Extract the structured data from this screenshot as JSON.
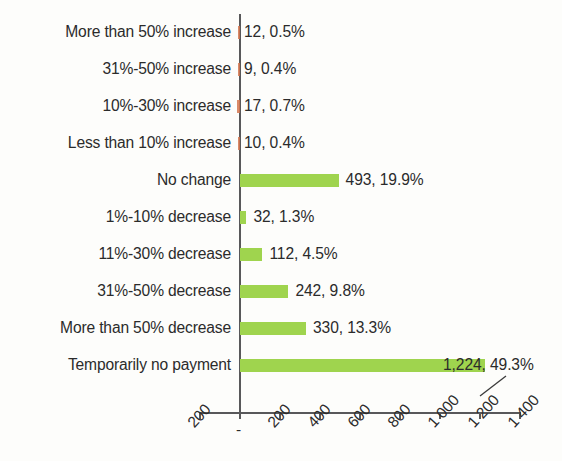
{
  "chart_data": {
    "type": "bar",
    "orientation": "horizontal",
    "title": "",
    "subtitle": "",
    "xlabel": "",
    "ylabel": "",
    "xlim": [
      -200,
      1400
    ],
    "grid": false,
    "legend": null,
    "axis_tick_labels": [
      "200",
      "-",
      "200",
      "400",
      "600",
      "800",
      "1 000",
      "1 200",
      "1 400"
    ],
    "axis_tick_values": [
      -200,
      0,
      200,
      400,
      600,
      800,
      1000,
      1200,
      1400
    ],
    "colors": {
      "positive_bar": "#9fd44e",
      "negative_bar": "#d4764f",
      "axis": "#58585a",
      "text": "#2b2b2b",
      "background": "#fdfdfb"
    },
    "categories": [
      "More than 50% increase",
      "31%-50% increase",
      "10%-30% increase",
      "Less than 10% increase",
      "No change",
      "1%-10% decrease",
      "11%-30% decrease",
      "31%-50% decrease",
      "More than 50% decrease",
      "Temporarily no payment"
    ],
    "values": [
      12,
      9,
      17,
      10,
      493,
      32,
      112,
      242,
      330,
      1224
    ],
    "percents": [
      0.5,
      0.4,
      0.7,
      0.4,
      19.9,
      1.3,
      4.5,
      9.8,
      13.3,
      49.3
    ],
    "plotted_values": [
      -12,
      -9,
      -17,
      -10,
      493,
      32,
      112,
      242,
      330,
      1224
    ],
    "data_labels": [
      "12,  0.5%",
      "9,  0.4%",
      "17,  0.7%",
      "10,  0.4%",
      "493, 19.9%",
      "32, 1.3%",
      "112,  4.5%",
      "242,  9.8%",
      "330, 13.3%",
      "1,224,  49.3%"
    ],
    "rows": [
      {
        "category": "More than 50% increase",
        "value": 12,
        "percent": 0.5,
        "plotted": -12,
        "label": "12,  0.5%",
        "sign": "neg",
        "callout": false
      },
      {
        "category": "31%-50% increase",
        "value": 9,
        "percent": 0.4,
        "plotted": -9,
        "label": "9,  0.4%",
        "sign": "neg",
        "callout": false
      },
      {
        "category": "10%-30% increase",
        "value": 17,
        "percent": 0.7,
        "plotted": -17,
        "label": "17,  0.7%",
        "sign": "neg",
        "callout": false
      },
      {
        "category": "Less than 10% increase",
        "value": 10,
        "percent": 0.4,
        "plotted": -10,
        "label": "10,  0.4%",
        "sign": "neg",
        "callout": false
      },
      {
        "category": "No change",
        "value": 493,
        "percent": 19.9,
        "plotted": 493,
        "label": "493, 19.9%",
        "sign": "pos",
        "callout": false
      },
      {
        "category": "1%-10% decrease",
        "value": 32,
        "percent": 1.3,
        "plotted": 32,
        "label": "32, 1.3%",
        "sign": "pos",
        "callout": false
      },
      {
        "category": "11%-30% decrease",
        "value": 112,
        "percent": 4.5,
        "plotted": 112,
        "label": "112,  4.5%",
        "sign": "pos",
        "callout": false
      },
      {
        "category": "31%-50% decrease",
        "value": 242,
        "percent": 9.8,
        "plotted": 242,
        "label": "242,  9.8%",
        "sign": "pos",
        "callout": false
      },
      {
        "category": "More than 50% decrease",
        "value": 330,
        "percent": 13.3,
        "plotted": 330,
        "label": "330, 13.3%",
        "sign": "pos",
        "callout": false
      },
      {
        "category": "Temporarily no payment",
        "value": 1224,
        "percent": 49.3,
        "plotted": 1224,
        "label": "1,224,  49.3%",
        "sign": "pos",
        "callout": true
      }
    ]
  }
}
